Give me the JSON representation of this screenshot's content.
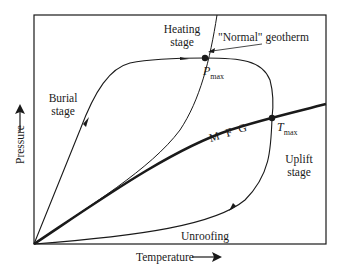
{
  "diagram": {
    "type": "P-T path diagram",
    "axes": {
      "x_label": "Temperature",
      "y_label": "Pressure"
    },
    "curves": {
      "geotherm_label": "\"Normal\" geotherm",
      "mfg_label": "M F G"
    },
    "points": {
      "pmax": {
        "main": "P",
        "sub": "max"
      },
      "tmax": {
        "main": "T",
        "sub": "max"
      }
    },
    "stages": {
      "heating": [
        "Heating",
        "stage"
      ],
      "burial": [
        "Burial",
        "stage"
      ],
      "uplift": [
        "Uplift",
        "stage"
      ],
      "unroofing": "Unroofing"
    },
    "colors": {
      "ink": "#1a1a1a",
      "background": "#ffffff"
    }
  }
}
